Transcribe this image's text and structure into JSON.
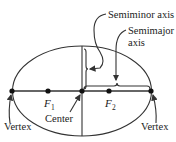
{
  "diagram": {
    "type": "ellipse-anatomy",
    "labels": {
      "semiminor_axis": "Semiminor axis",
      "semimajor_line1": "Semimajor",
      "semimajor_line2": "axis",
      "focus1": "F",
      "focus1_sub": "1",
      "focus2": "F",
      "focus2_sub": "2",
      "center": "Center",
      "vertex_left": "Vertex",
      "vertex_right": "Vertex"
    },
    "colors": {
      "line": "#333333",
      "text": "#222222",
      "background": "#ffffff"
    }
  }
}
